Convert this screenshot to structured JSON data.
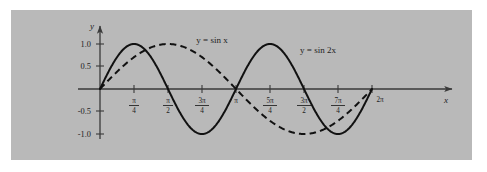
{
  "figure": {
    "panel_bg_color": "#b9b9b9",
    "page_bg_color": "#ffffff",
    "axis_color": "#3a3a3a",
    "curve_color": "#111111"
  },
  "axes": {
    "x_axis_name": "x",
    "y_axis_name": "y"
  },
  "labels": {
    "sin_x": "y = sin x",
    "sin_2x": "y = sin 2x"
  },
  "y_ticks": [
    {
      "label": "1.0",
      "value": 1.0
    },
    {
      "label": "0.5",
      "value": 0.5
    },
    {
      "label": "-0.5",
      "value": -0.5
    },
    {
      "label": "-1.0",
      "value": -1.0
    }
  ],
  "x_ticks": [
    {
      "label": "π/4",
      "num": "π",
      "den": "4",
      "whole": "",
      "value": 0.7853981634
    },
    {
      "label": "π/2",
      "num": "π",
      "den": "2",
      "whole": "",
      "value": 1.5707963268
    },
    {
      "label": "3π/4",
      "num": "3π",
      "den": "4",
      "whole": "",
      "value": 2.3561944902
    },
    {
      "label": "π",
      "num": "",
      "den": "",
      "whole": "π",
      "value": 3.1415926536
    },
    {
      "label": "5π/4",
      "num": "5π",
      "den": "4",
      "whole": "",
      "value": 3.926990817
    },
    {
      "label": "3π/2",
      "num": "3π",
      "den": "2",
      "whole": "",
      "value": 4.7123889804
    },
    {
      "label": "7π/4",
      "num": "7π",
      "den": "4",
      "whole": "",
      "value": 5.4977871438
    },
    {
      "label": "2π",
      "num": "",
      "den": "",
      "whole": "2π",
      "value": 6.2831853072
    }
  ],
  "chart_data": {
    "type": "line",
    "title": "",
    "xlabel": "x",
    "ylabel": "y",
    "xlim": [
      0,
      6.2831853072
    ],
    "ylim": [
      -1.0,
      1.0
    ],
    "grid": false,
    "legend": "inline-annotations",
    "x_tick_labels": [
      "π/4",
      "π/2",
      "3π/4",
      "π",
      "5π/4",
      "3π/2",
      "7π/4",
      "2π"
    ],
    "x_tick_values": [
      0.7853981634,
      1.5707963268,
      2.3561944902,
      3.1415926536,
      3.926990817,
      4.7123889804,
      5.4977871438,
      6.2831853072
    ],
    "y_tick_labels": [
      "1.0",
      "0.5",
      "-0.5",
      "-1.0"
    ],
    "y_tick_values": [
      1.0,
      0.5,
      -0.5,
      -1.0
    ],
    "series": [
      {
        "name": "y = sin x",
        "style": "dashed",
        "formula": "sin(x)",
        "period": 6.2831853072,
        "amplitude": 1.0,
        "x": [
          0,
          0.3926990817,
          0.7853981634,
          1.1780972451,
          1.5707963268,
          1.9634954085,
          2.3561944902,
          2.7488935719,
          3.1415926536,
          3.5342917353,
          3.926990817,
          4.3196898987,
          4.7123889804,
          5.1050880621,
          5.4977871438,
          5.8904862255,
          6.2831853072
        ],
        "values": [
          0.0,
          0.3827,
          0.7071,
          0.9239,
          1.0,
          0.9239,
          0.7071,
          0.3827,
          0.0,
          -0.3827,
          -0.7071,
          -0.9239,
          -1.0,
          -0.9239,
          -0.7071,
          -0.3827,
          0.0
        ]
      },
      {
        "name": "y = sin 2x",
        "style": "solid",
        "formula": "sin(2x)",
        "period": 3.1415926536,
        "amplitude": 1.0,
        "x": [
          0,
          0.3926990817,
          0.7853981634,
          1.1780972451,
          1.5707963268,
          1.9634954085,
          2.3561944902,
          2.7488935719,
          3.1415926536,
          3.5342917353,
          3.926990817,
          4.3196898987,
          4.7123889804,
          5.1050880621,
          5.4977871438,
          5.8904862255,
          6.2831853072
        ],
        "values": [
          0.0,
          0.7071,
          1.0,
          0.7071,
          0.0,
          -0.7071,
          -1.0,
          -0.7071,
          0.0,
          0.7071,
          1.0,
          0.7071,
          0.0,
          -0.7071,
          -1.0,
          -0.7071,
          0.0
        ]
      }
    ],
    "annotations": [
      {
        "text": "y = sin x",
        "x": 1.86,
        "y": 1.22
      },
      {
        "text": "y = sin 2x",
        "x": 4.95,
        "y": 1.02
      }
    ]
  }
}
